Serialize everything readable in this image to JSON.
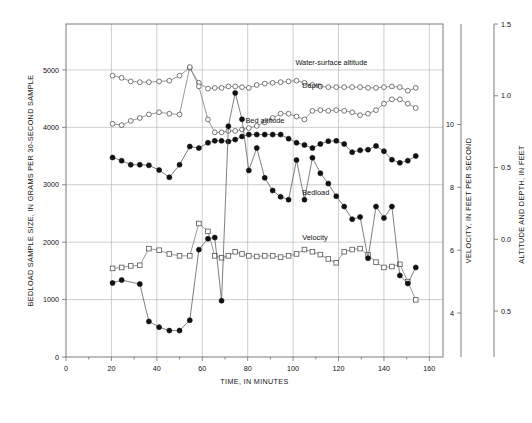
{
  "chart_data": {
    "type": "line",
    "title": "",
    "xlabel": "TIME, IN MINUTES",
    "ylabel": "BEDLOAD SAMPLE SIZE, IN GRAMS PER 30-SECOND SAMPLE",
    "y2label": "VELOCITY, IN FEET PER SECOND",
    "y3label": "ALTITUDE AND DEPTH, IN FEET",
    "grid": true,
    "legend": "inline-annotations",
    "xlim": [
      0,
      166
    ],
    "xticks": [
      0,
      20,
      40,
      60,
      80,
      100,
      120,
      140,
      160
    ],
    "xticklabels": [
      "0",
      "20",
      "40",
      "60",
      "80",
      "100",
      "120",
      "140",
      "160"
    ],
    "ylim": [
      0,
      5800
    ],
    "yticks": [
      0,
      1000,
      2000,
      3000,
      4000,
      5000
    ],
    "yticklabels": [
      "0",
      "1000",
      "2000",
      "3000",
      "4000",
      "5000"
    ],
    "y2lim": [
      2.6,
      13.2
    ],
    "y2ticks": [
      4,
      6,
      8,
      10
    ],
    "y2ticklabels": [
      "4",
      "6",
      "8",
      "10"
    ],
    "y3lim": [
      -0.82,
      1.5
    ],
    "y3ticks": [
      -0.5,
      0.0,
      0.5,
      1.0,
      1.5
    ],
    "y3ticklabels": [
      "0.5",
      "0.0",
      "0.5",
      "1.0",
      "1.5"
    ],
    "series": [
      {
        "name": "Water-surface altitude",
        "axis": "y3",
        "marker": "open-circle",
        "label_x": 101,
        "label_y": 1.215,
        "x": [
          20.5,
          24.5,
          28.5,
          32.5,
          36.5,
          41,
          45.5,
          50,
          54.5,
          58.5,
          62.5,
          65.5,
          68.5,
          71.5,
          74.5,
          77.5,
          80.5,
          84,
          87.5,
          91,
          94.5,
          98,
          101.5,
          105,
          108.5,
          112,
          115.5,
          119,
          122.5,
          126,
          129.5,
          133,
          136.5,
          140,
          143.5,
          147,
          150.5,
          154
        ],
        "y": [
          1.14,
          1.125,
          1.1,
          1.095,
          1.095,
          1.1,
          1.105,
          1.14,
          1.195,
          1.09,
          1.05,
          1.055,
          1.055,
          1.065,
          1.065,
          1.06,
          1.055,
          1.075,
          1.085,
          1.09,
          1.095,
          1.1,
          1.105,
          1.09,
          1.075,
          1.065,
          1.06,
          1.06,
          1.06,
          1.06,
          1.06,
          1.055,
          1.055,
          1.06,
          1.065,
          1.06,
          1.035,
          1.055
        ]
      },
      {
        "name": "Depth",
        "axis": "y3",
        "marker": "open-circle",
        "label_x": 104,
        "label_y": 1.055,
        "x": [
          20.5,
          24.5,
          28.5,
          32.5,
          36.5,
          41,
          45.5,
          50,
          54.5,
          58.5,
          62.5,
          65.5,
          68.5,
          71.5,
          74.5,
          77.5,
          80.5,
          84,
          87.5,
          91,
          94.5,
          98,
          101.5,
          105,
          108.5,
          112,
          115.5,
          119,
          122.5,
          126,
          129.5,
          133,
          136.5,
          140,
          143.5,
          147,
          150.5,
          154
        ],
        "y": [
          0.805,
          0.795,
          0.825,
          0.845,
          0.87,
          0.885,
          0.875,
          0.87,
          1.2,
          1.065,
          0.835,
          0.745,
          0.745,
          0.755,
          0.755,
          0.765,
          0.775,
          0.79,
          0.815,
          0.845,
          0.875,
          0.875,
          0.855,
          0.835,
          0.895,
          0.9,
          0.895,
          0.9,
          0.895,
          0.885,
          0.865,
          0.875,
          0.9,
          0.945,
          0.975,
          0.975,
          0.945,
          0.915
        ]
      },
      {
        "name": "Bed altitude",
        "axis": "y2",
        "marker": "filled-circle",
        "label_x": 79,
        "label_y": 10.05,
        "x": [
          20.5,
          24.5,
          28.5,
          32.5,
          36.5,
          41,
          45.5,
          50,
          54.5,
          58.5,
          62.5,
          65.5,
          68.5,
          71.5,
          74.5,
          77.5,
          80.5,
          84,
          87.5,
          91,
          94.5,
          98,
          101.5,
          105,
          108.5,
          112,
          115.5,
          119,
          122.5,
          126,
          129.5,
          133,
          136.5,
          140,
          143.5,
          147,
          150.5,
          154
        ],
        "y": [
          8.95,
          8.85,
          8.72,
          8.72,
          8.7,
          8.55,
          8.32,
          8.72,
          9.3,
          9.25,
          9.42,
          9.48,
          9.48,
          9.46,
          9.52,
          9.62,
          9.68,
          9.68,
          9.68,
          9.68,
          9.68,
          9.55,
          9.42,
          9.35,
          9.25,
          9.38,
          9.47,
          9.48,
          9.38,
          9.12,
          9.18,
          9.2,
          9.32,
          9.15,
          8.88,
          8.78,
          8.85,
          9.0
        ]
      },
      {
        "name": "Velocity",
        "axis": "y2",
        "marker": "open-square",
        "label_x": 104,
        "label_y": 6.33,
        "x": [
          20.5,
          24.5,
          28.5,
          32.5,
          36.5,
          41,
          45.5,
          50,
          54.5,
          58.5,
          62.5,
          65.5,
          68.5,
          71.5,
          74.5,
          77.5,
          80.5,
          84,
          87.5,
          91,
          94.5,
          98,
          101.5,
          105,
          108.5,
          112,
          115.5,
          119,
          122.5,
          126,
          129.5,
          133,
          136.5,
          140,
          143.5,
          147,
          150.5,
          154
        ],
        "y": [
          5.42,
          5.45,
          5.5,
          5.52,
          6.05,
          6.0,
          5.88,
          5.82,
          5.82,
          6.85,
          6.6,
          5.82,
          5.76,
          5.82,
          5.95,
          5.88,
          5.82,
          5.8,
          5.82,
          5.82,
          5.78,
          5.82,
          5.88,
          6.02,
          5.95,
          5.86,
          5.72,
          5.6,
          5.95,
          6.02,
          6.05,
          5.85,
          5.62,
          5.45,
          5.48,
          5.55,
          5.0,
          4.42
        ]
      },
      {
        "name": "Bedload",
        "axis": "y",
        "marker": "filled-circle",
        "label_x": 104,
        "label_y": 2830,
        "x": [
          20.5,
          24.5,
          32.5,
          36.5,
          41,
          45.5,
          50,
          54.5,
          58.5,
          62.5,
          65.5,
          68.5,
          71.5,
          74.5,
          77.5,
          80.5,
          84,
          87.5,
          91,
          94.5,
          98,
          101.5,
          105,
          108.5,
          112,
          115.5,
          119,
          122.5,
          126,
          129.5,
          133,
          136.5,
          140,
          143.5,
          147,
          150.5,
          154
        ],
        "y": [
          1290,
          1340,
          1270,
          620,
          520,
          460,
          460,
          640,
          1870,
          2060,
          2080,
          980,
          4020,
          4600,
          4140,
          3250,
          3640,
          3120,
          2900,
          2790,
          2740,
          3430,
          2740,
          3470,
          3200,
          3020,
          2800,
          2620,
          2400,
          2440,
          1720,
          2620,
          2420,
          2620,
          1420,
          1280,
          1560
        ]
      }
    ]
  },
  "axes": {
    "left": {
      "title": "BEDLOAD SAMPLE SIZE, IN GRAMS PER 30-SECOND SAMPLE"
    },
    "bottom": {
      "title": "TIME, IN MINUTES"
    },
    "right_inner": {
      "title": "VELOCITY, IN FEET PER SECOND"
    },
    "right_outer": {
      "title": "ALTITUDE AND DEPTH, IN FEET"
    }
  },
  "style": {
    "grid_color": "#b9b9b9",
    "frame_color": "#7a7a7a",
    "text_color": "#111111",
    "filled_marker_color": "#111111",
    "open_marker_fill": "#ffffff",
    "line_color": "#555555",
    "background": "#ffffff"
  }
}
